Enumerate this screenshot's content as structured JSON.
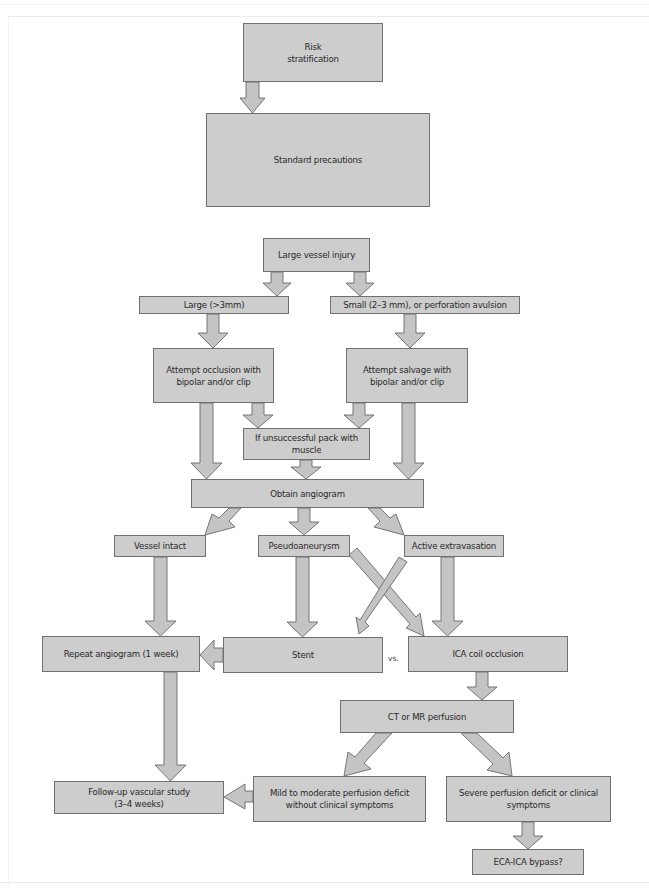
{
  "diagram": {
    "type": "flowchart",
    "fill_color": "#cdcdcd",
    "border_color": "#707070",
    "nodes": {
      "risk": "Risk\nstratification",
      "standard": "Standard precautions",
      "large_vessel": "Large vessel injury",
      "large": "Large (>3mm)",
      "small": "Small (2–3 mm), or perforation avulsion",
      "occlusion": "Attempt occlusion with\nbipolar and/or clip",
      "salvage": "Attempt salvage with\nbipolar and/or clip",
      "pack": "If unsuccessful pack with\nmuscle",
      "angiogram": "Obtain angiogram",
      "intact": "Vessel intact",
      "pseudo": "Pseudoaneurysm",
      "extrav": "Active extravasation",
      "repeat": "Repeat angiogram (1 week)",
      "stent": "Stent",
      "vs": "vs.",
      "ica_coil": "ICA coil occlusion",
      "perfusion": "CT or MR perfusion",
      "followup": "Follow-up vascular study\n(3–4 weeks)",
      "mild": "Mild to moderate perfusion deficit\nwithout clinical symptoms",
      "severe": "Severe perfusion deficit or clinical\nsymptoms",
      "bypass": "ECA-ICA bypass?"
    },
    "edges": [
      [
        "risk",
        "standard"
      ],
      [
        "large_vessel",
        "large"
      ],
      [
        "large_vessel",
        "small"
      ],
      [
        "large",
        "occlusion"
      ],
      [
        "small",
        "salvage"
      ],
      [
        "occlusion",
        "pack"
      ],
      [
        "salvage",
        "pack"
      ],
      [
        "occlusion",
        "angiogram"
      ],
      [
        "salvage",
        "angiogram"
      ],
      [
        "pack",
        "angiogram"
      ],
      [
        "angiogram",
        "intact"
      ],
      [
        "angiogram",
        "pseudo"
      ],
      [
        "angiogram",
        "extrav"
      ],
      [
        "intact",
        "repeat"
      ],
      [
        "pseudo",
        "stent"
      ],
      [
        "pseudo",
        "ica_coil"
      ],
      [
        "extrav",
        "stent"
      ],
      [
        "extrav",
        "ica_coil"
      ],
      [
        "stent",
        "repeat"
      ],
      [
        "ica_coil",
        "perfusion"
      ],
      [
        "repeat",
        "followup"
      ],
      [
        "perfusion",
        "mild"
      ],
      [
        "perfusion",
        "severe"
      ],
      [
        "mild",
        "followup"
      ],
      [
        "severe",
        "bypass"
      ]
    ]
  }
}
